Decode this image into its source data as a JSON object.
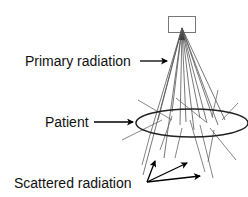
{
  "diagram": {
    "labels": {
      "primary": "Primary radiation",
      "patient": "Patient",
      "scattered": "Scattered radiation"
    },
    "components": {
      "source": "x-ray-tube-source",
      "patient_body": "patient-ellipse"
    },
    "colors": {
      "ink": "#111111",
      "beam": "#555555",
      "scatter": "#666666",
      "background": "#ffffff"
    }
  }
}
